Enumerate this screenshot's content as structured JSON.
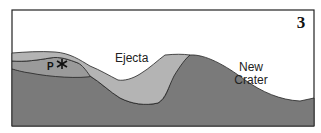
{
  "figure": {
    "panel_number": "3",
    "labels": {
      "ejecta": "Ejecta",
      "new_crater_line1": "New",
      "new_crater_line2": "Crater",
      "point": "P"
    },
    "colors": {
      "background": "#ffffff",
      "bedrock": "#7a7a7a",
      "ejecta_layer": "#b4b4b4",
      "middle_layer": "#9a9a9a",
      "outline": "#222222"
    }
  }
}
